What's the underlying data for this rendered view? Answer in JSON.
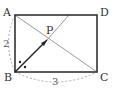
{
  "diagram": {
    "type": "geometry-rectangle",
    "points": {
      "A": {
        "label": "A"
      },
      "B": {
        "label": "B"
      },
      "C": {
        "label": "C"
      },
      "D": {
        "label": "D"
      },
      "P": {
        "label": "P"
      }
    },
    "dimensions": {
      "AB": "2",
      "BC": "3"
    },
    "colors": {
      "rectangle": "#333333",
      "diagonal": "#9a9a9a",
      "dashed_arc": "#aaaaaa",
      "bisector": "#222222"
    }
  }
}
